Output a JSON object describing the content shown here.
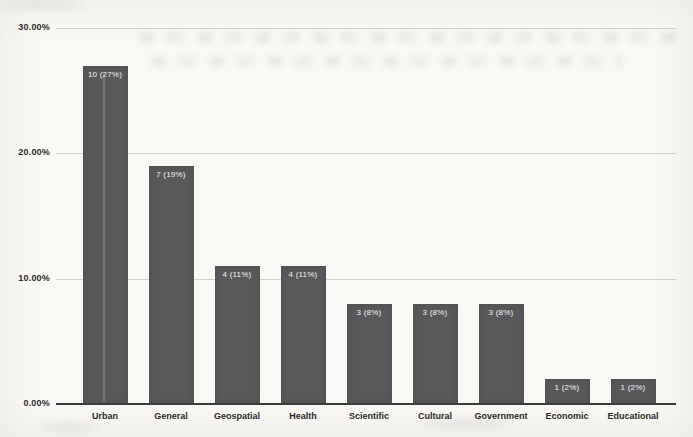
{
  "chart_data": {
    "type": "bar",
    "title": "",
    "xlabel": "",
    "ylabel": "",
    "categories": [
      "Urban",
      "General",
      "Geospatial",
      "Health",
      "Scientific",
      "Cultural",
      "Government",
      "Economic",
      "Educational"
    ],
    "values": [
      27,
      19,
      11,
      11,
      8,
      8,
      8,
      2,
      2
    ],
    "counts": [
      10,
      7,
      4,
      4,
      3,
      3,
      3,
      1,
      1
    ],
    "bar_labels": [
      "10 (27%)",
      "7 (19%)",
      "4 (11%)",
      "4 (11%)",
      "3 (8%)",
      "3 (8%)",
      "3 (8%)",
      "1 (2%)",
      "1 (2%)"
    ],
    "ylim": [
      0,
      30
    ],
    "y_ticks": [
      {
        "label": "30.00%",
        "value": 30
      },
      {
        "label": "20.00%",
        "value": 20
      },
      {
        "label": "10.00%",
        "value": 10
      },
      {
        "label": "0.00%",
        "value": 0
      }
    ],
    "grid": true,
    "legend": false,
    "bar_color": "#59595c",
    "bar_label_color": "#f2f1ee",
    "axis_text_color": "#2b2a28"
  }
}
